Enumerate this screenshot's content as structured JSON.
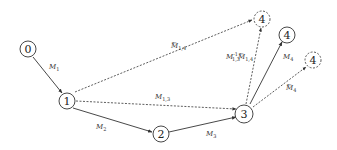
{
  "diagram": {
    "type": "directed-graph",
    "colors": {
      "stroke": "#333333",
      "background": "#ffffff"
    },
    "nodes": [
      {
        "id": "n0",
        "label": "0",
        "style": "solid"
      },
      {
        "id": "n1",
        "label": "1",
        "style": "solid"
      },
      {
        "id": "n2",
        "label": "2",
        "style": "solid"
      },
      {
        "id": "n3",
        "label": "3",
        "style": "solid"
      },
      {
        "id": "n4a",
        "label": "4",
        "style": "dashed"
      },
      {
        "id": "n4b",
        "label": "4",
        "style": "solid"
      },
      {
        "id": "n4c",
        "label": "4",
        "style": "dashed"
      }
    ],
    "edges": [
      {
        "from": "0",
        "to": "1",
        "style": "solid",
        "label": "M",
        "sub": "1",
        "sup": "",
        "tilde": false
      },
      {
        "from": "1",
        "to": "2",
        "style": "solid",
        "label": "M",
        "sub": "2",
        "sup": "",
        "tilde": false
      },
      {
        "from": "2",
        "to": "3",
        "style": "solid",
        "label": "M",
        "sub": "3",
        "sup": "",
        "tilde": false
      },
      {
        "from": "1",
        "to": "3",
        "style": "dashed",
        "label": "M",
        "sub": "1,3",
        "sup": "",
        "tilde": false
      },
      {
        "from": "1",
        "to": "4",
        "style": "dashed",
        "label": "M",
        "sub": "1,4",
        "sup": "",
        "tilde": true
      },
      {
        "from": "3",
        "to": "4",
        "style": "dashed",
        "label": "M",
        "sub": "1,3",
        "sup": "-1",
        "tilde": false,
        "label2": "M",
        "sub2": "1,4",
        "tilde2": true
      },
      {
        "from": "3",
        "to": "4",
        "style": "solid",
        "label": "M",
        "sub": "4",
        "sup": "",
        "tilde": false
      },
      {
        "from": "3",
        "to": "4",
        "style": "dashed",
        "label": "M",
        "sub": "4",
        "sup": "",
        "tilde": true
      }
    ]
  }
}
